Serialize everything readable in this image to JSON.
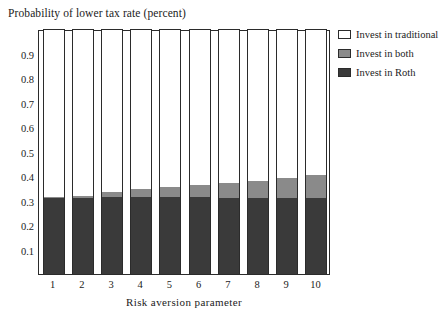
{
  "chart_data": {
    "type": "bar",
    "subtype": "stacked-100-percent",
    "title": "Probability of lower tax rate (percent)",
    "xlabel": "Risk aversion parameter",
    "ylabel": "",
    "categories": [
      "1",
      "2",
      "3",
      "4",
      "5",
      "6",
      "7",
      "8",
      "9",
      "10"
    ],
    "ylim": [
      0,
      1
    ],
    "ytick_labels": [
      "0.1",
      "0.2",
      "0.3",
      "0.4",
      "0.5",
      "0.6",
      "0.7",
      "0.8",
      "0.9"
    ],
    "ytick_values": [
      0.1,
      0.2,
      0.3,
      0.4,
      0.5,
      0.6,
      0.7,
      0.8,
      0.9
    ],
    "grid": false,
    "legend_position": "right-top",
    "stack_order_bottom_to_top": [
      "Invest in Roth",
      "Invest in both",
      "Invest in traditional"
    ],
    "series": [
      {
        "name": "Invest in Roth",
        "color": "#3a3a3a",
        "values": [
          0.31,
          0.31,
          0.315,
          0.315,
          0.315,
          0.315,
          0.312,
          0.312,
          0.31,
          0.31
        ]
      },
      {
        "name": "Invest in both",
        "color": "#8a8a8a",
        "values": [
          0.005,
          0.01,
          0.02,
          0.03,
          0.04,
          0.048,
          0.058,
          0.068,
          0.082,
          0.095
        ]
      },
      {
        "name": "Invest in traditional",
        "color": "#ffffff",
        "values": [
          0.685,
          0.68,
          0.665,
          0.655,
          0.645,
          0.637,
          0.63,
          0.62,
          0.608,
          0.595
        ]
      }
    ],
    "cumulative_tops": {
      "roth": [
        0.31,
        0.31,
        0.315,
        0.315,
        0.315,
        0.315,
        0.312,
        0.312,
        0.31,
        0.31
      ],
      "both": [
        0.315,
        0.32,
        0.335,
        0.345,
        0.355,
        0.363,
        0.37,
        0.38,
        0.392,
        0.405
      ]
    }
  },
  "legend": {
    "items": [
      {
        "label": "Invest in traditional",
        "color": "#ffffff"
      },
      {
        "label": "Invest in both",
        "color": "#8a8a8a"
      },
      {
        "label": "Invest in Roth",
        "color": "#3a3a3a"
      }
    ]
  },
  "colors": {
    "axis": "#2b2b2b",
    "text": "#1b1b1b",
    "background": "#ffffff",
    "roth": "#3a3a3a",
    "both": "#8a8a8a",
    "traditional": "#ffffff"
  }
}
